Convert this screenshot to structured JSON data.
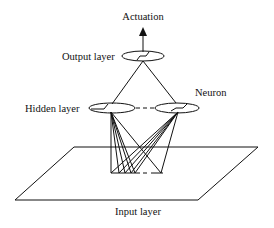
{
  "diagram": {
    "labels": {
      "actuation": "Actuation",
      "output_layer": "Output layer",
      "hidden_layer": "Hidden layer",
      "neuron": "Neuron",
      "input_layer": "Input layer"
    },
    "layers": [
      {
        "name": "Output layer",
        "neurons": 1
      },
      {
        "name": "Hidden layer",
        "neurons": "2 shown (dashed = more)"
      },
      {
        "name": "Input layer",
        "neurons": "multiple inputs on a plane (dashed = more)"
      }
    ],
    "colors": {
      "line": "#111111",
      "background": "#ffffff"
    }
  }
}
